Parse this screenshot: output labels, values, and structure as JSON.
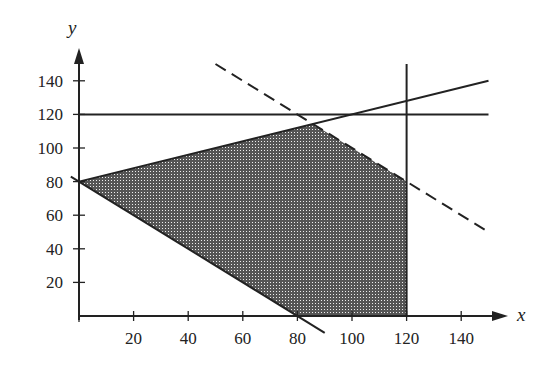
{
  "chart_data": {
    "type": "line",
    "title": "",
    "xlabel": "x",
    "ylabel": "y",
    "xlim": [
      0,
      150
    ],
    "ylim": [
      0,
      150
    ],
    "x_ticks": [
      20,
      40,
      60,
      80,
      100,
      120,
      140
    ],
    "y_ticks": [
      20,
      40,
      60,
      80,
      100,
      120,
      140
    ],
    "grid": false,
    "series": [
      {
        "name": "y = 120",
        "style": "solid",
        "points": [
          [
            0,
            120
          ],
          [
            150,
            120
          ]
        ]
      },
      {
        "name": "x = 120",
        "style": "solid",
        "points": [
          [
            120,
            0
          ],
          [
            120,
            150
          ]
        ]
      },
      {
        "name": "y = 80 + 0.4x",
        "style": "solid",
        "points": [
          [
            0,
            80
          ],
          [
            150,
            140
          ]
        ]
      },
      {
        "name": "x + y = 80",
        "style": "solid",
        "points": [
          [
            -3,
            83
          ],
          [
            90,
            -10
          ]
        ]
      },
      {
        "name": "x + y = 200",
        "style": "dashed",
        "points": [
          [
            50,
            150
          ],
          [
            150,
            50
          ]
        ]
      }
    ],
    "shaded_region": {
      "name": "feasible region",
      "pattern": "crosshatch",
      "vertices": [
        [
          0,
          80
        ],
        [
          85.7,
          114.3
        ],
        [
          120,
          80
        ],
        [
          120,
          0
        ],
        [
          80,
          0
        ]
      ]
    }
  }
}
